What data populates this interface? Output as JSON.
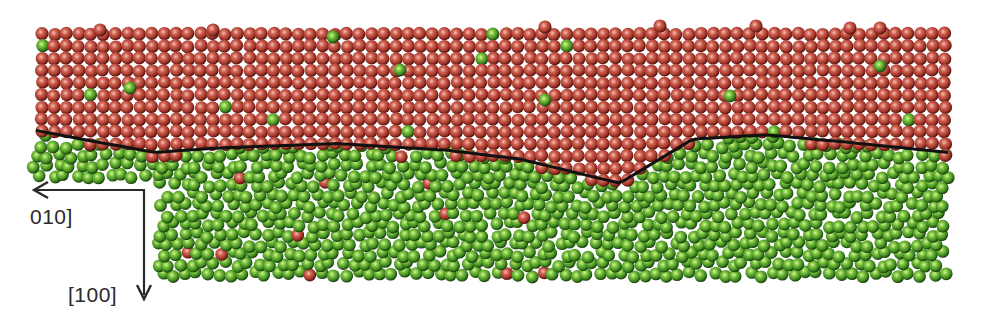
{
  "figure": {
    "axes": {
      "horizontal_label": "010]",
      "vertical_label": "[100]",
      "horizontal_direction": "left",
      "vertical_direction": "down"
    },
    "phases": [
      {
        "name": "crystalline",
        "region": "top",
        "color": "#b5453a",
        "highlight": "#f2b3a6",
        "shadow": "#5a1410"
      },
      {
        "name": "amorphous",
        "region": "bottom",
        "color": "#4f9a2a",
        "highlight": "#c9ef8a",
        "shadow": "#1f4a0e"
      }
    ],
    "interface": {
      "color": "#111111",
      "profile_x_fraction": [
        0.0,
        0.05,
        0.13,
        0.2,
        0.33,
        0.45,
        0.53,
        0.64,
        0.72,
        0.8,
        0.88,
        1.0
      ],
      "profile_depth_fraction": [
        0.42,
        0.46,
        0.52,
        0.5,
        0.48,
        0.51,
        0.55,
        0.66,
        0.46,
        0.44,
        0.47,
        0.52
      ]
    },
    "counts": {
      "green_in_red": 10,
      "red_in_green": 14
    }
  }
}
